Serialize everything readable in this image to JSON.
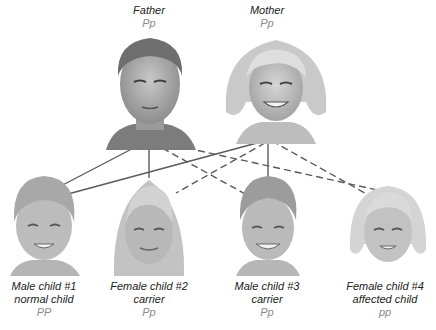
{
  "colors": {
    "text": "#222222",
    "genotype": "#8a8a8a",
    "line": "#555555",
    "skin": "#b9b9b9",
    "hair_dark": "#7a7a7a",
    "hair_light": "#d6d6d6"
  },
  "parents": [
    {
      "id": "father",
      "label": "Father",
      "genotype": "Pp"
    },
    {
      "id": "mother",
      "label": "Mother",
      "genotype": "Pp"
    }
  ],
  "children": [
    {
      "id": "child1",
      "label": "Male child #1",
      "status": "normal child",
      "genotype": "PP"
    },
    {
      "id": "child2",
      "label": "Female child #2",
      "status": "carrier",
      "genotype": "Pp"
    },
    {
      "id": "child3",
      "label": "Male child #3",
      "status": "carrier",
      "genotype": "Pp"
    },
    {
      "id": "child4",
      "label": "Female child #4",
      "status": "affected child",
      "genotype": "pp"
    }
  ],
  "legend_lines": {
    "solid": "dominant allele P passed",
    "dashed": "recessive allele p passed"
  }
}
